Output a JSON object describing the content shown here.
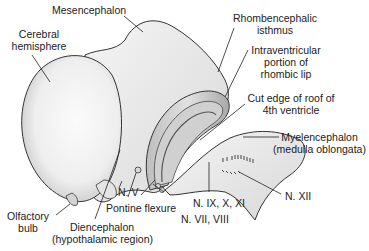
{
  "diagram": {
    "type": "anatomical illustration",
    "labels": {
      "mesencephalon": "Mesencephalon",
      "cerebral_hemisphere": [
        "Cerebral",
        "hemisphere"
      ],
      "rhombencephalic_isthmus": [
        "Rhombencephalic",
        "isthmus"
      ],
      "intraventricular_rhombic_lip": [
        "Intraventricular",
        "portion of",
        "rhombic lip"
      ],
      "cut_edge_roof": [
        "Cut edge of roof of",
        "4th ventricle"
      ],
      "myelencephalon": [
        "Myelencephalon",
        "(medulla oblongata)"
      ],
      "n_v": "N. V",
      "pontine_flexure": "Pontine flexure",
      "n_ix_x_xi": "N. IX, X, XI",
      "n_vii_viii": "N. VII, VIII",
      "n_xii": "N. XII",
      "olfactory_bulb": [
        "Olfactory",
        "bulb"
      ],
      "diencephalon": [
        "Diencephalon",
        "(hypothalamic region)"
      ]
    }
  }
}
